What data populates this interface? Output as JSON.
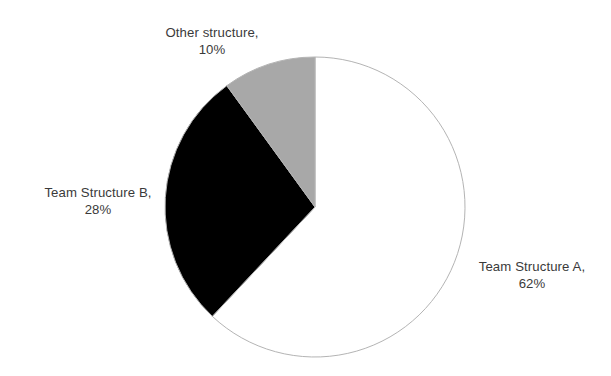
{
  "chart_data": {
    "type": "pie",
    "title": "",
    "labels": [
      "Team Structure A",
      "Team Structure B",
      "Other structure"
    ],
    "values": [
      62,
      28,
      10
    ],
    "value_suffix": "%",
    "colors": [
      "#ffffff",
      "#000000",
      "#a8a8a8"
    ],
    "slice_stroke": "#b4b4b4",
    "background": "#ffffff",
    "start_angle_deg": 0,
    "direction": "clockwise",
    "legend": "none",
    "grid": false,
    "slices": [
      {
        "name": "Team Structure A",
        "value": 62,
        "display_value": "62%",
        "color": "#ffffff",
        "label_line1": "Team Structure A,",
        "label_line2": "62%"
      },
      {
        "name": "Team Structure B",
        "value": 28,
        "display_value": "28%",
        "color": "#000000",
        "label_line1": "Team Structure B,",
        "label_line2": "28%"
      },
      {
        "name": "Other structure",
        "value": 10,
        "display_value": "10%",
        "color": "#a8a8a8",
        "label_line1": "Other structure,",
        "label_line2": "10%"
      }
    ]
  },
  "geometry": {
    "center_x": 315,
    "center_y": 207,
    "radius": 150
  }
}
